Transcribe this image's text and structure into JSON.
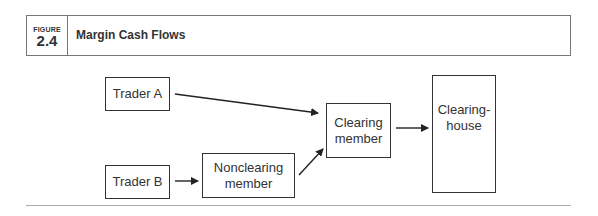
{
  "figure": {
    "label": "FIGURE",
    "number": "2.4",
    "title": "Margin Cash Flows"
  },
  "diagram": {
    "nodes": [
      {
        "id": "trader_a",
        "label": "Trader A"
      },
      {
        "id": "trader_b",
        "label": "Trader B"
      },
      {
        "id": "nonclearing_member",
        "label": "Nonclearing member"
      },
      {
        "id": "clearing_member",
        "label": "Clearing member"
      },
      {
        "id": "clearinghouse",
        "label": "Clearing-house"
      }
    ],
    "edges": [
      {
        "from": "trader_a",
        "to": "clearing_member"
      },
      {
        "from": "trader_b",
        "to": "nonclearing_member"
      },
      {
        "from": "nonclearing_member",
        "to": "clearing_member"
      },
      {
        "from": "clearing_member",
        "to": "clearinghouse"
      }
    ]
  },
  "labels": {
    "trader_a": "Trader A",
    "trader_b": "Trader B",
    "nonclearing_1": "Nonclearing",
    "nonclearing_2": "member",
    "clearing_1": "Clearing",
    "clearing_2": "member",
    "house_1": "Clearing-",
    "house_2": "house"
  }
}
